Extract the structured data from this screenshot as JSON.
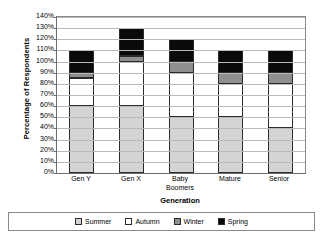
{
  "chart_data": {
    "type": "bar",
    "subtype": "stacked-bar",
    "title": "",
    "xlabel": "Generation",
    "ylabel": "Percentage of Respondents",
    "categories": [
      "Gen Y",
      "Gen X",
      "Baby Boomers",
      "Mature",
      "Senior"
    ],
    "series": [
      {
        "name": "Summer",
        "color": "#d4d4d4",
        "values": [
          60,
          60,
          50,
          50,
          40
        ]
      },
      {
        "name": "Autumn",
        "color": "#ffffff",
        "values": [
          25,
          40,
          40,
          30,
          40
        ]
      },
      {
        "name": "Winter",
        "color": "#8f8f8f",
        "values": [
          5,
          5,
          10,
          10,
          10
        ]
      },
      {
        "name": "Spring",
        "color": "#0a0a0a",
        "values": [
          20,
          25,
          20,
          20,
          20
        ]
      }
    ],
    "totals": [
      110,
      130,
      120,
      110,
      110
    ],
    "ylim": [
      0,
      140
    ],
    "ytick_step": 10,
    "ytick_labels": [
      "140%",
      "130%",
      "120%",
      "110%",
      "100%",
      "90%",
      "80%",
      "70%",
      "60%",
      "50%",
      "40%",
      "30%",
      "20%",
      "10%",
      "0%"
    ],
    "ytick_values": [
      140,
      130,
      120,
      110,
      100,
      90,
      80,
      70,
      60,
      50,
      40,
      30,
      20,
      10,
      0
    ],
    "grid": true,
    "legend_position": "bottom",
    "legend_entries": [
      "Summer",
      "Autumn",
      "Winter",
      "Spring"
    ]
  },
  "axes": {
    "y_title": "Percentage of Respondents",
    "x_title": "Generation"
  }
}
